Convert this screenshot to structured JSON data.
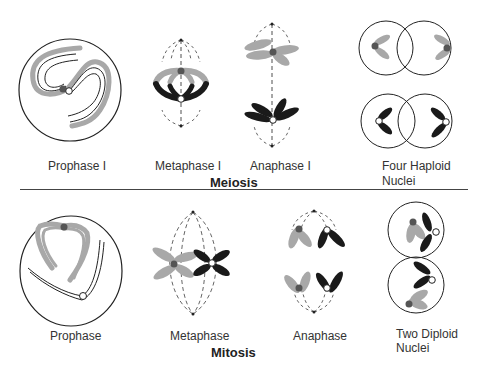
{
  "colors": {
    "homolog_light": "#a8a8a8",
    "homolog_dark": "#1a1a1a",
    "line": "#222222",
    "centromere_dark": "#555555"
  },
  "meiosis": {
    "title": "Meiosis",
    "stages": [
      {
        "label": "Prophase I"
      },
      {
        "label": "Metaphase I"
      },
      {
        "label": "Anaphase I"
      },
      {
        "label_line1": "Four Haploid",
        "label_line2": "Nuclei"
      }
    ]
  },
  "mitosis": {
    "title": "Mitosis",
    "stages": [
      {
        "label": "Prophase"
      },
      {
        "label": "Metaphase"
      },
      {
        "label": "Anaphase"
      },
      {
        "label_line1": "Two Diploid",
        "label_line2": "Nuclei"
      }
    ]
  }
}
